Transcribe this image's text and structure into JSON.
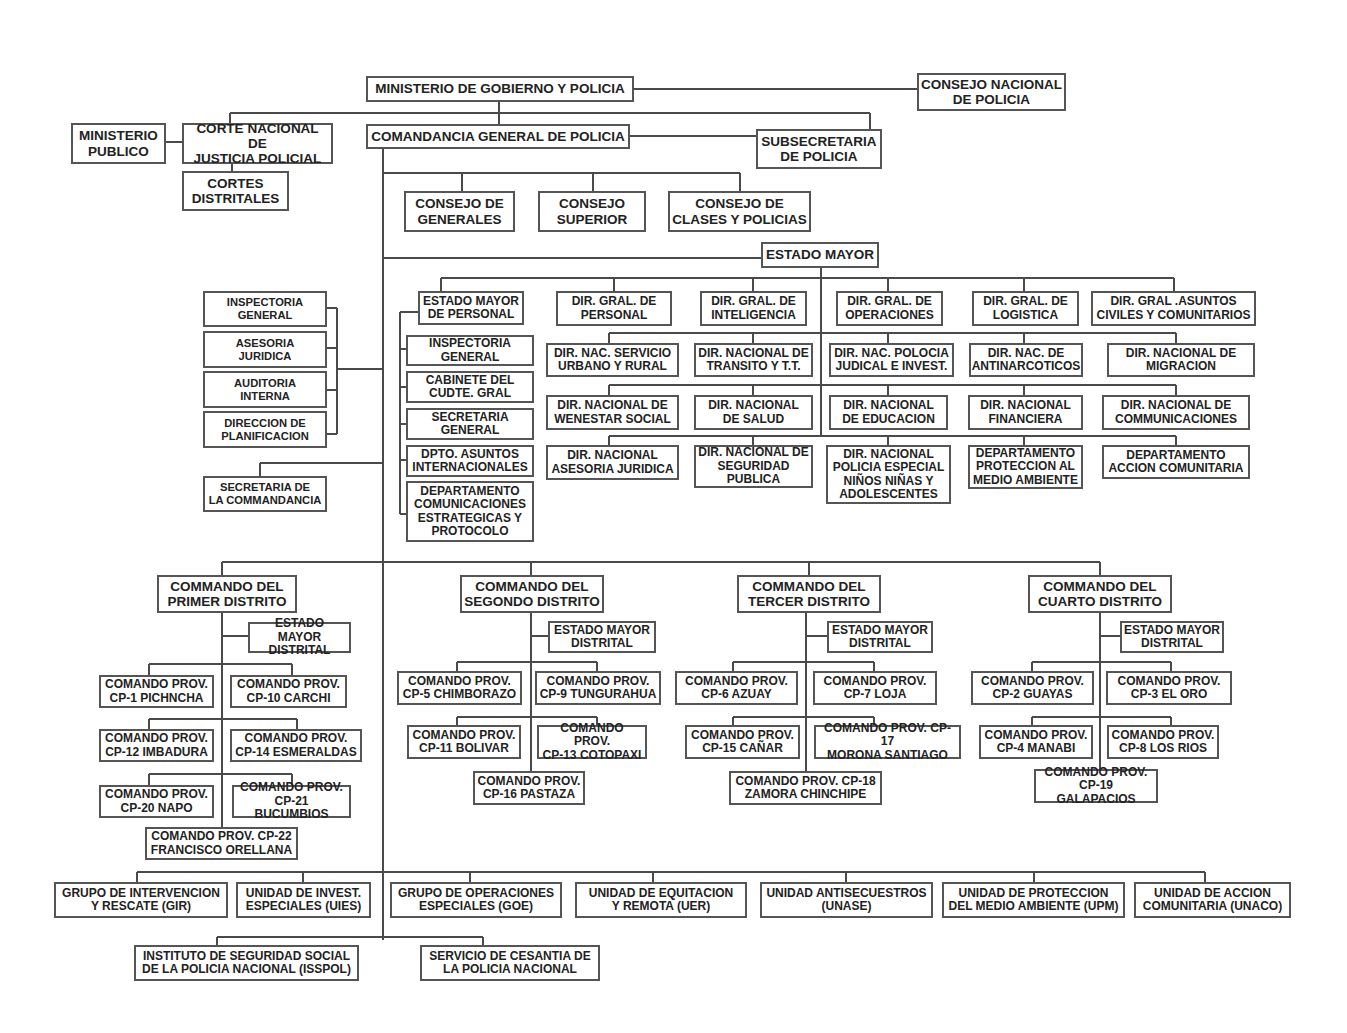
{
  "org_chart": {
    "top": {
      "ministerio_gobierno": "MINISTERIO DE GOBIERNO Y POLICIA",
      "consejo_nacional": "CONSEJO NACIONAL\nDE POLICIA",
      "ministerio_publico": "MINISTERIO\nPUBLICO",
      "corte_nacional": "CORTE NACIONAL DE\nJUSTICIA POLICIAL",
      "cortes_distritales": "CORTES\nDISTRITALES",
      "comandancia_general": "COMANDANCIA GENERAL DE POLICIA",
      "subsecretaria": "SUBSECRETARIA\nDE POLICIA"
    },
    "consejos": [
      "CONSEJO DE\nGENERALES",
      "CONSEJO\nSUPERIOR",
      "CONSEJO DE\nCLASES Y POLICIAS"
    ],
    "estado_mayor": "ESTADO MAYOR",
    "staff_left": [
      "INSPECTORIA\nGENERAL",
      "ASESORIA\nJURIDICA",
      "AUDITORIA\nINTERNA",
      "DIRECCION DE\nPLANIFICACION"
    ],
    "secretaria_commandancia": "SECRETARIA DE\nLA COMMANDANCIA",
    "estado_mayor_personal": "ESTADO MAYOR\nDE PERSONAL",
    "personal_units": [
      "INSPECTORIA\nGENERAL",
      "CABINETE DEL\nCUDTE. GRAL",
      "SECRETARIA\nGENERAL",
      "DPTO. ASUNTOS\nINTERNACIONALES",
      "DEPARTAMENTO\nCOMUNICACIONES\nESTRATEGICAS Y\nPROTOCOLO"
    ],
    "dir_generales": [
      "DIR. GRAL. DE\nPERSONAL",
      "DIR. GRAL. DE\nINTELIGENCIA",
      "DIR. GRAL. DE\nOPERACIONES",
      "DIR. GRAL. DE\nLOGISTICA",
      "DIR. GRAL .ASUNTOS\nCIVILES Y COMUNITARIOS"
    ],
    "dir_nacionales_row1": [
      "DIR. NAC. SERVICIO\nURBANO Y RURAL",
      "DIR. NACIONAL DE\nTRANSITO Y T.T.",
      "DIR. NAC. POLOCIA\nJUDICAL E INVEST.",
      "DIR. NAC. DE\nANTINARCOTICOS",
      "DIR. NACIONAL DE\nMIGRACION"
    ],
    "dir_nacionales_row2": [
      "DIR. NACIONAL DE\nWENESTAR SOCIAL",
      "DIR. NACIONAL\nDE SALUD",
      "DIR. NACIONAL\nDE EDUCACION",
      "DIR. NACIONAL\nFINANCIERA",
      "DIR. NACIONAL DE\nCOMMUNICACIONES"
    ],
    "dir_nacionales_row3": [
      "DIR. NACIONAL\nASESORIA JURIDICA",
      "DIR. NACIONAL DE\nSEGURIDAD\nPUBLICA",
      "DIR. NACIONAL\nPOLICIA ESPECIAL\nNIÑOS NIÑAS Y\nADOLESCENTES",
      "DEPARTAMENTO\nPROTECCION AL\nMEDIO AMBIENTE",
      "DEPARTAMENTO\nACCION COMUNITARIA"
    ],
    "districts": [
      {
        "title": "COMMANDO DEL\nPRIMER DISTRITO",
        "estado_mayor": "ESTADO MAYOR\nDISTRITAL",
        "provinces": [
          "COMANDO PROV.\nCP-1 PICHNCHA",
          "COMANDO PROV.\nCP-10 CARCHI",
          "COMANDO PROV.\nCP-12 IMBADURA",
          "COMANDO PROV.\nCP-14 ESMERALDAS",
          "COMANDO PROV.\nCP-20 NAPO",
          "COMANDO PROV.\nCP-21 BUCUMBIOS",
          "COMANDO PROV. CP-22\nFRANCISCO ORELLANA"
        ]
      },
      {
        "title": "COMMANDO DEL\nSEGONDO DISTRITO",
        "estado_mayor": "ESTADO MAYOR\nDISTRITAL",
        "provinces": [
          "COMANDO PROV.\nCP-5 CHIMBORAZO",
          "COMANDO PROV.\nCP-9 TUNGURAHUA",
          "COMANDO PROV.\nCP-11 BOLIVAR",
          "COMANDO PROV.\nCP-13 COTOPAXI",
          "COMANDO PROV.\nCP-16 PASTAZA"
        ]
      },
      {
        "title": "COMMANDO DEL\nTERCER DISTRITO",
        "estado_mayor": "ESTADO MAYOR\nDISTRITAL",
        "provinces": [
          "COMANDO PROV.\nCP-6 AZUAY",
          "COMANDO PROV.\nCP-7 LOJA",
          "COMANDO PROV.\nCP-15 CAÑAR",
          "COMANDO PROV. CP-17\nMORONA SANTIAGO",
          "COMANDO PROV. CP-18\nZAMORA CHINCHIPE"
        ]
      },
      {
        "title": "COMMANDO DEL\nCUARTO DISTRITO",
        "estado_mayor": "ESTADO MAYOR\nDISTRITAL",
        "provinces": [
          "COMANDO PROV.\nCP-2 GUAYAS",
          "COMANDO PROV.\nCP-3 EL ORO",
          "COMANDO PROV.\nCP-4 MANABI",
          "COMANDO PROV.\nCP-8 LOS RIOS",
          "COMANDO PROV.\nCP-19 GALAPACIOS"
        ]
      }
    ],
    "special_units": [
      "GRUPO DE INTERVENCION\nY RESCATE (GIR)",
      "UNIDAD DE INVEST.\nESPECIALES (UIES)",
      "GRUPO DE OPERACIONES\nESPECIALES (GOE)",
      "UNIDAD DE EQUITACION\nY REMOTA (UER)",
      "UNIDAD ANTISECUESTROS\n(UNASE)",
      "UNIDAD DE PROTECCION\nDEL MEDIO AMBIENTE (UPM)",
      "UNIDAD DE ACCION\nCOMUNITARIA (UNACO)"
    ],
    "bottom": [
      "INSTITUTO DE SEGURIDAD SOCIAL\nDE LA POLICIA NACIONAL (ISSPOL)",
      "SERVICIO DE CESANTIA DE\nLA POLICIA NACIONAL"
    ]
  },
  "colors": {
    "line": "#4a4a4a",
    "border": "#555555",
    "text": "#222222",
    "background": "#ffffff"
  }
}
